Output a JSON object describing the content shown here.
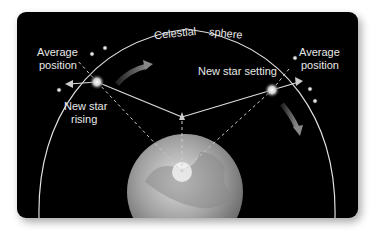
{
  "diagram": {
    "labels": {
      "celestial": "Celestial",
      "sphere": "sphere",
      "avg_left_1": "Average",
      "avg_left_2": "position",
      "avg_right_1": "Average",
      "avg_right_2": "position",
      "rising_1": "New star",
      "rising_2": "rising",
      "setting": "New star setting"
    },
    "colors": {
      "background": "#000000",
      "lines": "#d8d8d8",
      "earth": "#9a9a9a",
      "arrow": "#777777"
    }
  }
}
